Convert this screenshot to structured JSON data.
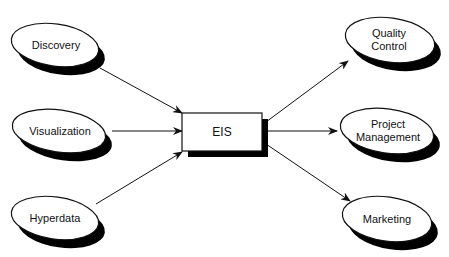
{
  "diagram": {
    "center": {
      "label": "EIS"
    },
    "inputs": [
      {
        "label": "Discovery"
      },
      {
        "label": "Visualization"
      },
      {
        "label": "Hyperdata"
      }
    ],
    "outputs": [
      {
        "label": "Quality\nControl"
      },
      {
        "label": "Project\nManagement"
      },
      {
        "label": "Marketing"
      }
    ],
    "colors": {
      "stroke": "#111111",
      "shadow": "#000000",
      "fill": "#ffffff"
    }
  }
}
